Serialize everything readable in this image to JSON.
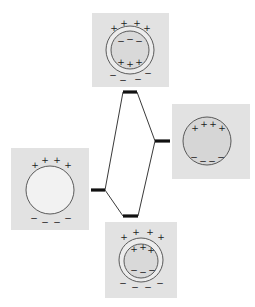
{
  "diagram": {
    "type": "plasmon-hybridization-energy-diagram",
    "colors": {
      "panel_bg": "#e2e2e2",
      "sphere_fill": "#f4f4f4",
      "shell_fill": "#d6d6d6",
      "level_bar": "#111111",
      "connector": "#222222",
      "outline": "#555555"
    },
    "nodes": [
      {
        "id": "sphere",
        "label": "sphere-plasmon",
        "position": "left",
        "charges": {
          "top": [
            "+",
            "+",
            "+",
            "+"
          ],
          "bottom": [
            "−",
            "−",
            "−",
            "−"
          ]
        }
      },
      {
        "id": "cavity",
        "label": "cavity-plasmon",
        "position": "right",
        "charges": {
          "top": [
            "+",
            "+",
            "+",
            "+"
          ],
          "bottom": [
            "−",
            "−",
            "−",
            "−"
          ]
        }
      },
      {
        "id": "antibonding",
        "label": "antibonding-shell-plasmon",
        "position": "top",
        "charges": {
          "outer_top": [
            "+",
            "+",
            "+",
            "+"
          ],
          "inner_top": [
            "−",
            "−",
            "−"
          ],
          "inner_bottom": [
            "+",
            "+",
            "+"
          ],
          "outer_bottom": [
            "−",
            "−",
            "−",
            "−"
          ]
        }
      },
      {
        "id": "bonding",
        "label": "bonding-shell-plasmon",
        "position": "bottom",
        "charges": {
          "outer_top": [
            "+",
            "+",
            "+",
            "+"
          ],
          "inner_top": [
            "+",
            "+",
            "+"
          ],
          "inner_bottom": [
            "−",
            "−",
            "−"
          ],
          "outer_bottom": [
            "−",
            "−",
            "−",
            "−"
          ]
        }
      }
    ],
    "levels": [
      {
        "id": "sphere",
        "x1": 91,
        "x2": 105,
        "y": 190
      },
      {
        "id": "cavity",
        "x1": 155,
        "x2": 170,
        "y": 141
      },
      {
        "id": "antibonding",
        "x1": 123,
        "x2": 137,
        "y": 92
      },
      {
        "id": "bonding",
        "x1": 123,
        "x2": 138,
        "y": 216
      }
    ],
    "edges": [
      {
        "from": "sphere",
        "to": "antibonding"
      },
      {
        "from": "sphere",
        "to": "bonding"
      },
      {
        "from": "cavity",
        "to": "antibonding"
      },
      {
        "from": "cavity",
        "to": "bonding"
      }
    ]
  }
}
